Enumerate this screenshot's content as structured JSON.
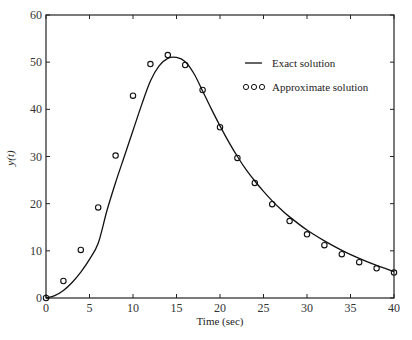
{
  "chart_data": {
    "type": "line",
    "title": "",
    "xlabel": "Time (sec)",
    "ylabel": "y(t)",
    "xlim": [
      0,
      40
    ],
    "ylim": [
      0,
      60
    ],
    "xticks": [
      0,
      5,
      10,
      15,
      20,
      25,
      30,
      35,
      40
    ],
    "yticks": [
      0,
      10,
      20,
      30,
      40,
      50,
      60
    ],
    "grid": false,
    "legend_position": "upper right (inside)",
    "series": [
      {
        "name": "Exact solution",
        "style": "solid line",
        "color": "#111111",
        "x": [
          0,
          1,
          2,
          3,
          4,
          5,
          6,
          7,
          8,
          9,
          10,
          11,
          12,
          13,
          14,
          15,
          16,
          17,
          18,
          19,
          20,
          21,
          22,
          23,
          24,
          25,
          26,
          27,
          28,
          30,
          32,
          34,
          36,
          38,
          40
        ],
        "values": [
          0,
          0.5,
          1.6,
          3.3,
          5.5,
          8.2,
          11.6,
          18.5,
          24.5,
          30.0,
          35.5,
          41.0,
          46.0,
          49.2,
          50.8,
          51.0,
          50.1,
          47.6,
          43.9,
          40.1,
          36.5,
          33.1,
          30.0,
          27.2,
          24.8,
          22.6,
          20.6,
          18.8,
          17.2,
          14.4,
          12.1,
          10.1,
          8.4,
          6.9,
          5.6
        ]
      },
      {
        "name": "Approximate solution",
        "style": "open circle markers",
        "color": "#111111",
        "x": [
          0,
          2,
          4,
          6,
          8,
          10,
          12,
          14,
          16,
          18,
          20,
          22,
          24,
          26,
          28,
          30,
          32,
          34,
          36,
          38,
          40
        ],
        "values": [
          0,
          3.6,
          10.2,
          19.2,
          30.2,
          42.9,
          49.6,
          51.5,
          49.4,
          44.1,
          36.2,
          29.7,
          24.4,
          19.9,
          16.3,
          13.5,
          11.2,
          9.3,
          7.6,
          6.3,
          5.4
        ]
      }
    ]
  },
  "legend": {
    "items": [
      {
        "label": "Exact solution",
        "symbol": "line"
      },
      {
        "label": "Approximate solution",
        "symbol": "circles"
      }
    ]
  }
}
